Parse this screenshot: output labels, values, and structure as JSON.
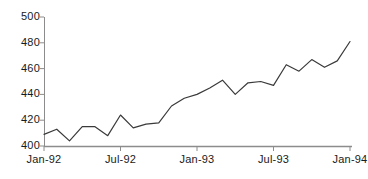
{
  "chart_data": {
    "type": "line",
    "title": "",
    "subtitle": "",
    "xlabel": "",
    "ylabel": "",
    "ylim": [
      400,
      500
    ],
    "ytick_values": [
      400,
      420,
      440,
      460,
      480,
      500
    ],
    "ytick_labels": [
      "400",
      "420",
      "440",
      "460",
      "480",
      "500"
    ],
    "xtick_labels": [
      "Jan-92",
      "Jul-92",
      "Jan-93",
      "Jul-93",
      "Jan-94"
    ],
    "xtick_index": [
      0,
      6,
      12,
      18,
      24
    ],
    "grid": false,
    "legend": false,
    "legend_position": "none",
    "line_color": "#3a3a3a",
    "axis_color": "#8c8c8c",
    "background_color": "#ffffff",
    "x": [
      "Jan-92",
      "Feb-92",
      "Mar-92",
      "Apr-92",
      "May-92",
      "Jun-92",
      "Jul-92",
      "Aug-92",
      "Sep-92",
      "Oct-92",
      "Nov-92",
      "Dec-92",
      "Jan-93",
      "Feb-93",
      "Mar-93",
      "Apr-93",
      "May-93",
      "Jun-93",
      "Jul-93",
      "Aug-93",
      "Sep-93",
      "Oct-93",
      "Nov-93",
      "Dec-93",
      "Jan-94"
    ],
    "series": [
      {
        "name": "series-1",
        "values": [
          409,
          413,
          404,
          415,
          415,
          408,
          424,
          414,
          417,
          418,
          431,
          437,
          440,
          445,
          451,
          440,
          449,
          450,
          447,
          463,
          458,
          467,
          461,
          466,
          481
        ]
      }
    ]
  }
}
